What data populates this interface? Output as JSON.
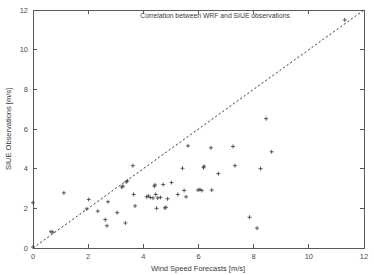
{
  "figure": {
    "background_color": "#ffffff",
    "axis_color": "#5a5a5a",
    "marker_color": "#4a4a4a",
    "line_color": "#3c3c3c"
  },
  "chart_data": {
    "type": "scatter",
    "title": "Correlation between WRF and SIUE observations",
    "xlabel": "Wind Speed Forecasts [m/s]",
    "ylabel": "SIUE Observations [m/s]",
    "xlim": [
      0,
      12
    ],
    "ylim": [
      0,
      12
    ],
    "xticks": [
      0,
      2,
      4,
      6,
      8,
      10,
      12
    ],
    "yticks": [
      0,
      2,
      4,
      6,
      8,
      10,
      12
    ],
    "xticklabels": [
      "0",
      "2",
      "4",
      "6",
      "8",
      "10",
      "12"
    ],
    "yticklabels": [
      "0",
      "2",
      "4",
      "6",
      "8",
      "10",
      "12"
    ],
    "grid": false,
    "legend": null,
    "marker_symbol": "plus",
    "reference_line": {
      "name": "one-to-one line",
      "style": "dashed",
      "x": [
        0,
        12
      ],
      "y": [
        0,
        12
      ]
    },
    "points": [
      [
        0.0,
        0.05
      ],
      [
        0.0,
        2.28
      ],
      [
        0.65,
        0.82
      ],
      [
        0.72,
        0.8
      ],
      [
        1.12,
        2.78
      ],
      [
        1.95,
        1.97
      ],
      [
        2.02,
        2.45
      ],
      [
        2.35,
        1.86
      ],
      [
        2.62,
        1.43
      ],
      [
        2.68,
        1.12
      ],
      [
        2.72,
        2.33
      ],
      [
        3.05,
        1.78
      ],
      [
        3.22,
        3.07
      ],
      [
        3.26,
        3.12
      ],
      [
        3.35,
        1.26
      ],
      [
        3.38,
        3.33
      ],
      [
        3.42,
        3.38
      ],
      [
        3.62,
        4.15
      ],
      [
        3.65,
        2.7
      ],
      [
        3.7,
        2.12
      ],
      [
        4.12,
        2.58
      ],
      [
        4.18,
        2.62
      ],
      [
        4.25,
        2.55
      ],
      [
        4.35,
        2.52
      ],
      [
        4.4,
        3.12
      ],
      [
        4.42,
        3.18
      ],
      [
        4.45,
        2.7
      ],
      [
        4.48,
        2.0
      ],
      [
        4.52,
        2.52
      ],
      [
        4.62,
        2.55
      ],
      [
        4.72,
        3.2
      ],
      [
        4.78,
        2.02
      ],
      [
        4.82,
        2.05
      ],
      [
        4.88,
        2.48
      ],
      [
        5.02,
        3.3
      ],
      [
        5.25,
        2.7
      ],
      [
        5.42,
        4.02
      ],
      [
        5.48,
        2.9
      ],
      [
        5.55,
        2.58
      ],
      [
        5.62,
        5.15
      ],
      [
        5.98,
        2.92
      ],
      [
        6.05,
        2.95
      ],
      [
        6.12,
        2.9
      ],
      [
        6.18,
        4.05
      ],
      [
        6.2,
        4.12
      ],
      [
        6.45,
        5.05
      ],
      [
        6.48,
        2.92
      ],
      [
        6.72,
        3.75
      ],
      [
        7.25,
        5.12
      ],
      [
        7.32,
        4.15
      ],
      [
        7.85,
        1.55
      ],
      [
        8.12,
        1.0
      ],
      [
        8.25,
        4.0
      ],
      [
        8.45,
        6.52
      ],
      [
        8.65,
        4.85
      ],
      [
        11.3,
        11.5
      ]
    ]
  }
}
